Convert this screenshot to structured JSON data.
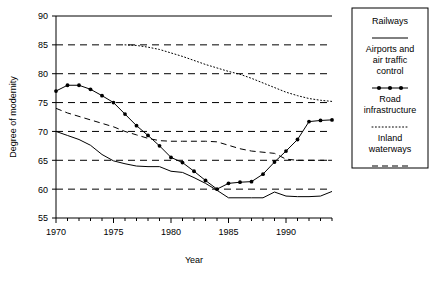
{
  "chart_data": {
    "type": "line",
    "title": "",
    "xlabel": "Year",
    "ylabel": "Degree of modernity",
    "xlim": [
      1970,
      1994
    ],
    "ylim": [
      55,
      90
    ],
    "yticks": [
      55,
      60,
      65,
      70,
      75,
      80,
      85,
      90
    ],
    "xticks": [
      1970,
      1975,
      1980,
      1985,
      1990
    ],
    "xtick_labels": [
      "1970",
      "1975",
      "1980",
      "1985",
      "1990"
    ],
    "ytick_labels": [
      "55",
      "60",
      "65",
      "70",
      "75",
      "80",
      "85",
      "90"
    ],
    "grid": "horizontal-dashed",
    "legend_position": "right-outside",
    "series": [
      {
        "name": "Railways",
        "style": "solid",
        "x": [
          1970,
          1971,
          1972,
          1973,
          1974,
          1975,
          1976,
          1977,
          1978,
          1979,
          1980,
          1981,
          1982,
          1983,
          1984,
          1985,
          1986,
          1987,
          1988,
          1989,
          1990,
          1991,
          1992,
          1993,
          1994
        ],
        "values": [
          70.0,
          69.3,
          68.6,
          67.6,
          66.0,
          64.9,
          64.4,
          64.0,
          63.9,
          63.9,
          63.1,
          62.9,
          62.0,
          61.0,
          59.8,
          58.5,
          58.5,
          58.5,
          58.5,
          59.5,
          58.8,
          58.7,
          58.7,
          58.8,
          59.6
        ]
      },
      {
        "name": "Airports and air traffic control",
        "style": "marker-line",
        "x": [
          1970,
          1971,
          1972,
          1973,
          1974,
          1975,
          1976,
          1977,
          1978,
          1979,
          1980,
          1981,
          1982,
          1983,
          1984,
          1985,
          1986,
          1987,
          1988,
          1989,
          1990,
          1991,
          1992,
          1993,
          1994
        ],
        "values": [
          77.0,
          78.0,
          78.0,
          77.3,
          76.2,
          75.0,
          73.0,
          71.0,
          69.3,
          67.5,
          65.5,
          64.6,
          63.1,
          61.5,
          60.0,
          61.0,
          61.2,
          61.3,
          62.6,
          64.7,
          66.6,
          68.6,
          71.7,
          71.9,
          72.0
        ]
      },
      {
        "name": "Road infrastructure",
        "style": "dotted",
        "x": [
          1976,
          1977,
          1978,
          1979,
          1980,
          1981,
          1982,
          1983,
          1984,
          1985,
          1986,
          1987,
          1988,
          1989,
          1990,
          1991,
          1992,
          1993,
          1994
        ],
        "values": [
          85.0,
          84.9,
          84.6,
          84.2,
          83.6,
          83.0,
          82.3,
          81.6,
          81.0,
          80.4,
          79.9,
          79.2,
          78.4,
          77.6,
          76.8,
          76.2,
          75.7,
          75.4,
          75.2
        ]
      },
      {
        "name": "Inland waterways",
        "style": "dashed",
        "x": [
          1970,
          1971,
          1972,
          1973,
          1974,
          1975,
          1976,
          1977,
          1978,
          1979,
          1980,
          1981,
          1982,
          1983,
          1984,
          1985,
          1986,
          1987,
          1988,
          1989,
          1990,
          1991,
          1992,
          1993,
          1994
        ],
        "values": [
          74.0,
          73.2,
          72.6,
          72.0,
          71.4,
          70.8,
          70.0,
          69.4,
          68.8,
          68.4,
          68.3,
          68.3,
          68.3,
          68.3,
          68.2,
          67.6,
          67.0,
          66.6,
          66.4,
          66.2,
          65.2,
          65.0,
          65.0,
          65.0,
          65.0
        ]
      }
    ]
  },
  "legend": {
    "entries": [
      {
        "label": "Railways",
        "style": "solid"
      },
      {
        "label": "Airports and\nair traffic\ncontrol",
        "style": "marker-line"
      },
      {
        "label": "Road\ninfrastructure",
        "style": "dotted"
      },
      {
        "label": "Inland\nwaterways",
        "style": "dashed"
      }
    ]
  }
}
